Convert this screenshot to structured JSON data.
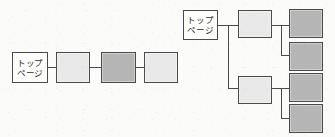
{
  "figure": {
    "type": "diagram",
    "background_color": "#fbfbfa",
    "line_color": "#4a4a4a",
    "fill_white": "#fdfdfc",
    "fill_light": "#e9e9e9",
    "fill_dark": "#b5b5b5"
  },
  "diagrams": [
    {
      "id": "linear",
      "name": "linear-chain-diagram",
      "root": {
        "label": "トップ\nページ",
        "label_line1": "トップ",
        "label_line2": "ページ",
        "fill": "white"
      },
      "nodes": [
        {
          "label": "",
          "fill": "light"
        },
        {
          "label": "",
          "fill": "dark"
        },
        {
          "label": "",
          "fill": "light"
        }
      ]
    },
    {
      "id": "tree",
      "name": "hierarchical-tree-diagram",
      "root": {
        "label": "トップ\nページ",
        "label_line1": "トップ",
        "label_line2": "ページ",
        "fill": "white"
      },
      "branches": [
        {
          "parent": {
            "label": "",
            "fill": "light"
          },
          "children": [
            {
              "label": "",
              "fill": "dark"
            },
            {
              "label": "",
              "fill": "dark"
            }
          ]
        },
        {
          "parent": {
            "label": "",
            "fill": "light"
          },
          "children": [
            {
              "label": "",
              "fill": "dark"
            },
            {
              "label": "",
              "fill": "dark"
            }
          ]
        }
      ]
    }
  ]
}
